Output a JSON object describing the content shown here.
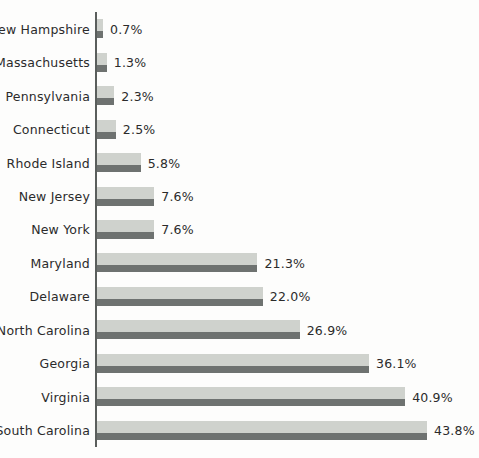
{
  "chart_data": {
    "type": "bar",
    "orientation": "horizontal",
    "title": "",
    "subtitle": "",
    "xlabel": "",
    "ylabel": "",
    "xlim": [
      0,
      50
    ],
    "grid": false,
    "legend": "none",
    "value_suffix": "%",
    "categories": [
      "New Hampshire",
      "Massachusetts",
      "Pennsylvania",
      "Connecticut",
      "Rhode Island",
      "New Jersey",
      "New York",
      "Maryland",
      "Delaware",
      "North Carolina",
      "Georgia",
      "Virginia",
      "South Carolina"
    ],
    "values": [
      0.7,
      1.3,
      2.3,
      2.5,
      5.8,
      7.6,
      7.6,
      21.3,
      22.0,
      26.9,
      36.1,
      40.9,
      43.8
    ],
    "value_labels": [
      "0.7%",
      "1.3%",
      "2.3%",
      "2.5%",
      "5.8%",
      "7.6%",
      "7.6%",
      "21.3%",
      "22.0%",
      "26.9%",
      "36.1%",
      "40.9%",
      "43.8%"
    ],
    "bars": [
      {
        "category": "New Hampshire",
        "value": 0.7,
        "label": "0.7%"
      },
      {
        "category": "Massachusetts",
        "value": 1.3,
        "label": "1.3%"
      },
      {
        "category": "Pennsylvania",
        "value": 2.3,
        "label": "2.3%"
      },
      {
        "category": "Connecticut",
        "value": 2.5,
        "label": "2.5%"
      },
      {
        "category": "Rhode Island",
        "value": 5.8,
        "label": "5.8%"
      },
      {
        "category": "New Jersey",
        "value": 7.6,
        "label": "7.6%"
      },
      {
        "category": "New York",
        "value": 7.6,
        "label": "7.6%"
      },
      {
        "category": "Maryland",
        "value": 21.3,
        "label": "21.3%"
      },
      {
        "category": "Delaware",
        "value": 22.0,
        "label": "22.0%"
      },
      {
        "category": "North Carolina",
        "value": 26.9,
        "label": "26.9%"
      },
      {
        "category": "Georgia",
        "value": 36.1,
        "label": "36.1%"
      },
      {
        "category": "Virginia",
        "value": 40.9,
        "label": "40.9%"
      },
      {
        "category": "South Carolina",
        "value": 43.8,
        "label": "43.8%"
      }
    ],
    "colors": {
      "bar_light": "#cfd2cd",
      "bar_dark": "#6e7270",
      "axis": "#5a5e5c",
      "text": "#2b2b2b",
      "background": "#fdfdfc"
    }
  }
}
